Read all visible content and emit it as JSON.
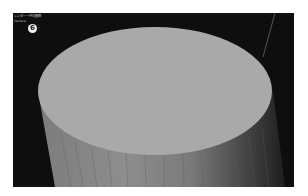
{
  "viewport": {
    "title_label": "レンダー・中の画面",
    "sub_label": "Camera",
    "step_badge": "6"
  },
  "scene": {
    "object": "cylinder",
    "colors": {
      "background": "#0e0e0e",
      "top_face": "#a9a9a9",
      "side_light": "#8e8e8e",
      "side_mid": "#6e6e6e",
      "side_dark": "#2a2a2a",
      "guide_line": "#6a6a6a"
    }
  }
}
